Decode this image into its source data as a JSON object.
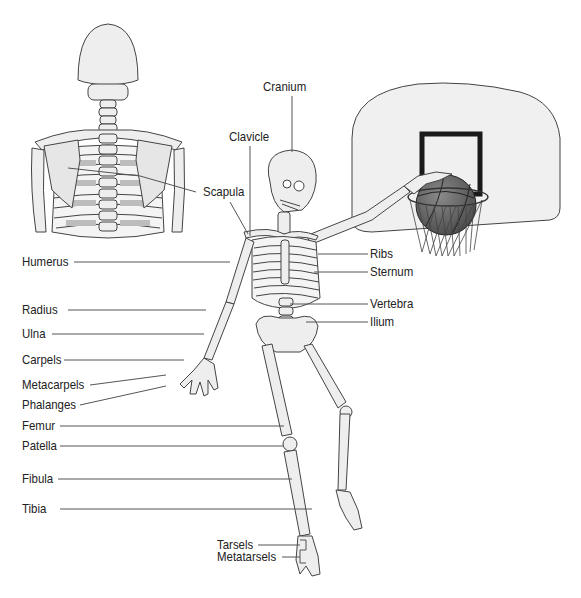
{
  "diagram": {
    "colors": {
      "bone_fill": "#eeeeee",
      "bone_shade": "#bdbdbd",
      "outline": "#444444",
      "leader_line": "#555555",
      "backboard_fill": "#f0f0f0",
      "target_square": "#1a1a1a",
      "ball": "#6b6b6b",
      "label_text": "#222222"
    },
    "inset": {
      "name": "Posterior view of upper skeleton"
    },
    "labels": {
      "cranium": "Cranium",
      "clavicle": "Clavicle",
      "scapula": "Scapula",
      "ribs": "Ribs",
      "sternum": "Sternum",
      "vertebra": "Vertebra",
      "ilium": "Ilium",
      "humerus": "Humerus",
      "radius": "Radius",
      "ulna": "Ulna",
      "carpels": "Carpels",
      "metacarpels": "Metacarpels",
      "phalanges": "Phalanges",
      "femur": "Femur",
      "patella": "Patella",
      "fibula": "Fibula",
      "tibia": "Tibia",
      "tarsels": "Tarsels",
      "metatarsels": "Metatarsels"
    }
  }
}
